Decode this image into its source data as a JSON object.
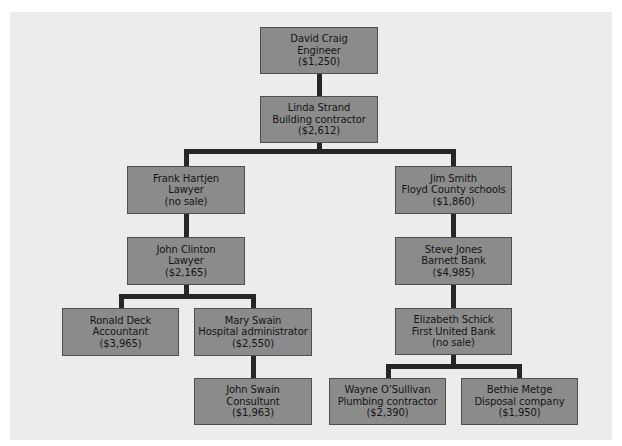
{
  "diagram": {
    "type": "referral-tree",
    "nodes": [
      {
        "id": "david-craig",
        "name": "David Craig",
        "role": "Engineer",
        "sale": "($1,250)",
        "parent": null
      },
      {
        "id": "linda-strand",
        "name": "Linda Strand",
        "role": "Building contractor",
        "sale": "($2,612)",
        "parent": "david-craig"
      },
      {
        "id": "frank-hartjen",
        "name": "Frank Hartjen",
        "role": "Lawyer",
        "sale": "(no sale)",
        "parent": "linda-strand"
      },
      {
        "id": "jim-smith",
        "name": "Jim Smith",
        "role": "Floyd County schools",
        "sale": "($1,860)",
        "parent": "linda-strand"
      },
      {
        "id": "john-clinton",
        "name": "John Clinton",
        "role": "Lawyer",
        "sale": "($2,165)",
        "parent": "frank-hartjen"
      },
      {
        "id": "steve-jones",
        "name": "Steve Jones",
        "role": "Barnett Bank",
        "sale": "($4,985)",
        "parent": "jim-smith"
      },
      {
        "id": "ronald-deck",
        "name": "Ronald Deck",
        "role": "Accountant",
        "sale": "($3,965)",
        "parent": "john-clinton"
      },
      {
        "id": "mary-swain",
        "name": "Mary Swain",
        "role": "Hospital administrator",
        "sale": "($2,550)",
        "parent": "john-clinton"
      },
      {
        "id": "elizabeth-schick",
        "name": "Elizabeth Schick",
        "role": "First United Bank",
        "sale": "(no sale)",
        "parent": "steve-jones"
      },
      {
        "id": "john-swain",
        "name": "John Swain",
        "role": "Consultunt",
        "sale": "($1,963)",
        "parent": "mary-swain"
      },
      {
        "id": "wayne-osullivan",
        "name": "Wayne O’Sullivan",
        "role": "Plumbing contractor",
        "sale": "($2,390)",
        "parent": "elizabeth-schick"
      },
      {
        "id": "bethie-metge",
        "name": "Bethie Metge",
        "role": "Disposal company",
        "sale": "($1,950)",
        "parent": "elizabeth-schick"
      }
    ]
  },
  "colors": {
    "panel_background": "#ececec",
    "node_fill": "#8b8b8b",
    "node_border": "#4f4f4f",
    "connector": "#262626",
    "text": "#151515"
  }
}
